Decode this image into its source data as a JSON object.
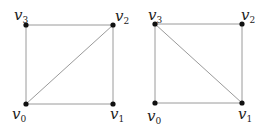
{
  "figure": {
    "graphs": [
      {
        "name": "left-square",
        "vertices": [
          {
            "id": "v0",
            "label": "v",
            "sub": "0"
          },
          {
            "id": "v1",
            "label": "v",
            "sub": "1"
          },
          {
            "id": "v2",
            "label": "v",
            "sub": "2"
          },
          {
            "id": "v3",
            "label": "v",
            "sub": "3"
          }
        ],
        "edges": [
          [
            "v0",
            "v1"
          ],
          [
            "v1",
            "v2"
          ],
          [
            "v2",
            "v3"
          ],
          [
            "v3",
            "v0"
          ],
          [
            "v0",
            "v2"
          ]
        ]
      },
      {
        "name": "right-square",
        "vertices": [
          {
            "id": "v0",
            "label": "v",
            "sub": "0"
          },
          {
            "id": "v1",
            "label": "v",
            "sub": "1"
          },
          {
            "id": "v2",
            "label": "v",
            "sub": "2"
          },
          {
            "id": "v3",
            "label": "v",
            "sub": "3"
          }
        ],
        "edges": [
          [
            "v0",
            "v1"
          ],
          [
            "v1",
            "v2"
          ],
          [
            "v2",
            "v3"
          ],
          [
            "v3",
            "v0"
          ],
          [
            "v3",
            "v1"
          ]
        ]
      }
    ]
  }
}
